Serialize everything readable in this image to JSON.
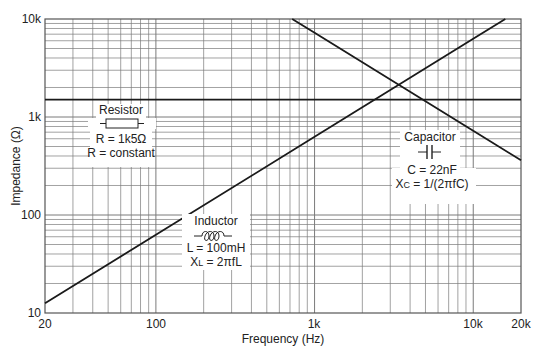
{
  "chart_data": {
    "type": "line",
    "title": "",
    "xlabel": "Frequency (Hz)",
    "ylabel": "Impedance (Ω)",
    "xscale": "log",
    "yscale": "log",
    "xlim": [
      20,
      20000
    ],
    "ylim": [
      10,
      10000
    ],
    "grid": true,
    "x_tick_labels": [
      "20",
      "100",
      "1k",
      "10k",
      "20k"
    ],
    "x_tick_values": [
      20,
      100,
      1000,
      10000,
      20000
    ],
    "y_tick_labels": [
      "10",
      "100",
      "1k",
      "10k"
    ],
    "y_tick_values": [
      10,
      100,
      1000,
      10000
    ],
    "series": [
      {
        "name": "Resistor",
        "formula": "R = constant",
        "value_label": "R = 1k5Ω",
        "x": [
          20,
          20000
        ],
        "y": [
          1500,
          1500
        ]
      },
      {
        "name": "Inductor",
        "formula": "XL = 2πfL",
        "value_label": "L = 100mH",
        "x": [
          20,
          100,
          1000,
          10000,
          15915
        ],
        "y": [
          12.6,
          62.8,
          628,
          6283,
          10000
        ]
      },
      {
        "name": "Capacitor",
        "formula": "XC = 1/(2πfC)",
        "value_label": "C = 22nF",
        "x": [
          723,
          1000,
          10000,
          20000
        ],
        "y": [
          10000,
          7234,
          723,
          362
        ]
      }
    ],
    "annotations": [
      {
        "text": "Resistor",
        "lines": [
          "Resistor",
          "R = 1k5Ω",
          "R = constant"
        ]
      },
      {
        "text": "Capacitor",
        "lines": [
          "Capacitor",
          "C = 22nF",
          "XC = 1/(2πfC)"
        ]
      },
      {
        "text": "Inductor",
        "lines": [
          "Inductor",
          "L = 100mH",
          "XL = 2πfL"
        ]
      }
    ]
  },
  "labels": {
    "xlabel": "Frequency (Hz)",
    "ylabel": "Impedance (Ω)",
    "xticks": [
      "20",
      "100",
      "1k",
      "10k",
      "20k"
    ],
    "yticks": [
      "10",
      "100",
      "1k",
      "10k"
    ],
    "resistor": {
      "title": "Resistor",
      "value": "R = 1k5Ω",
      "formula": "R = constant"
    },
    "capacitor": {
      "title": "Capacitor",
      "value": "C = 22nF",
      "formula_main": "X",
      "formula_sub": "C",
      "formula_rest": " = 1/(2πfC)"
    },
    "inductor": {
      "title": "Inductor",
      "value": "L = 100mH",
      "formula_main": "X",
      "formula_sub": "L",
      "formula_rest": " = 2πfL"
    }
  },
  "colors": {
    "line": "#1a1a1a",
    "grid": "#7a7a7a",
    "axis": "#555555",
    "background": "#ffffff"
  }
}
